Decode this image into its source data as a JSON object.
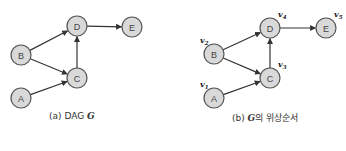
{
  "figure": {
    "panels": [
      {
        "id": "a",
        "caption_prefix": "(a) DAG ",
        "caption_symbol": "G",
        "caption_suffix": "",
        "nodes": [
          {
            "id": "A",
            "label": "A",
            "x": 21,
            "y": 98
          },
          {
            "id": "B",
            "label": "B",
            "x": 21,
            "y": 55
          },
          {
            "id": "C",
            "label": "C",
            "x": 77,
            "y": 78
          },
          {
            "id": "D",
            "label": "D",
            "x": 77,
            "y": 26
          },
          {
            "id": "E",
            "label": "E",
            "x": 132,
            "y": 27
          }
        ],
        "edges": [
          [
            "A",
            "C"
          ],
          [
            "B",
            "C"
          ],
          [
            "B",
            "D"
          ],
          [
            "C",
            "D"
          ],
          [
            "D",
            "E"
          ]
        ]
      },
      {
        "id": "b",
        "caption_prefix": "(b) ",
        "caption_symbol": "G",
        "caption_suffix": "의 위상순서",
        "nodes": [
          {
            "id": "A",
            "label": "A",
            "x": 214,
            "y": 98,
            "order": "v",
            "order_sub": "1"
          },
          {
            "id": "B",
            "label": "B",
            "x": 214,
            "y": 54,
            "order": "v",
            "order_sub": "2"
          },
          {
            "id": "C",
            "label": "C",
            "x": 270,
            "y": 78,
            "order": "v",
            "order_sub": "3"
          },
          {
            "id": "D",
            "label": "D",
            "x": 270,
            "y": 28,
            "order": "v",
            "order_sub": "4"
          },
          {
            "id": "E",
            "label": "E",
            "x": 326,
            "y": 28,
            "order": "v",
            "order_sub": "5"
          }
        ],
        "edges": [
          [
            "A",
            "C"
          ],
          [
            "B",
            "C"
          ],
          [
            "B",
            "D"
          ],
          [
            "C",
            "D"
          ],
          [
            "D",
            "E"
          ]
        ]
      }
    ],
    "node_radius": 10,
    "colors": {
      "node_fill": "#d9d9d9",
      "node_stroke": "#555555",
      "edge": "#333333"
    }
  }
}
